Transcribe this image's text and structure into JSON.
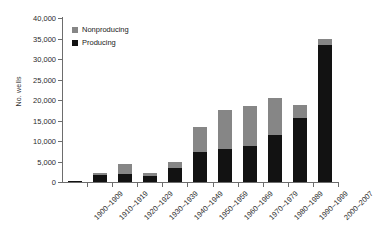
{
  "chart_data": {
    "type": "bar",
    "subtype": "stacked-vertical-bar",
    "title": "",
    "xlabel": "",
    "ylabel": "No. wells",
    "ylim": [
      0,
      40000
    ],
    "ytick_step": 5000,
    "ytick_labels": [
      "0",
      "5,000",
      "10,000",
      "15,000",
      "20,000",
      "25,000",
      "30,000",
      "35,000",
      "40,000"
    ],
    "ytick_values": [
      0,
      5000,
      10000,
      15000,
      20000,
      25000,
      30000,
      35000,
      40000
    ],
    "grid": false,
    "legend_position": "top-left-inside",
    "categories": [
      "1900–1909",
      "1910–1919",
      "1920–1929",
      "1930–1939",
      "1940–1949",
      "1950–1959",
      "1960–1969",
      "1970–1979",
      "1980–1989",
      "1990–1999",
      "2000–2007"
    ],
    "series": [
      {
        "name": "Producing",
        "color": "#121212",
        "values": [
          100,
          1800,
          1950,
          1400,
          3300,
          7400,
          8000,
          8900,
          11400,
          15700,
          33500
        ]
      },
      {
        "name": "Nonproducing",
        "color": "#868686",
        "values": [
          0,
          500,
          2550,
          800,
          1500,
          6100,
          9600,
          9700,
          9100,
          3000,
          1500
        ]
      }
    ],
    "totals": [
      100,
      2300,
      4500,
      2200,
      4800,
      13500,
      17600,
      18600,
      20500,
      18700,
      35000
    ]
  },
  "legend": {
    "entries": [
      {
        "label": "Nonproducing",
        "color": "#868686"
      },
      {
        "label": "Producing",
        "color": "#121212"
      }
    ]
  }
}
